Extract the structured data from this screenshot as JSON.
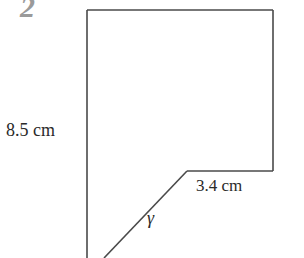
{
  "figure": {
    "number": "2",
    "labels": {
      "left_side": "8.5 cm",
      "bottom_segment": "3.4 cm",
      "angle": "γ"
    },
    "shape": {
      "points": [
        [
          87,
          10
        ],
        [
          273,
          10
        ],
        [
          273,
          171
        ],
        [
          187,
          171
        ],
        [
          105,
          258
        ],
        [
          87,
          258
        ]
      ],
      "stroke": "#4a4a4a"
    }
  }
}
